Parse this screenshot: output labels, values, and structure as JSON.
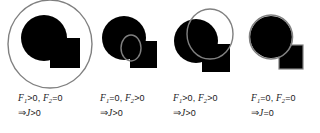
{
  "figure": {
    "name": "overlap-condition-figure",
    "background_color": "#ffffff",
    "shape_fill_color": "#000000",
    "outline_color": "#808080",
    "panel_count": 4
  },
  "panels": [
    {
      "id": "panel-1",
      "label": "large-enclosing-ellipse",
      "caption_line_1": {
        "f1_symbol": "F",
        "f1_subscript": "1",
        "f1_relation": ">0,",
        "f2_symbol": "F",
        "f2_subscript": "2",
        "f2_relation": "=0"
      },
      "caption_line_2": {
        "arrow": "⇒",
        "j_symbol": "J",
        "j_relation": ">0"
      },
      "shapes": {
        "circle": {
          "cx": 42,
          "cy": 38,
          "r": 23,
          "fill": "#000000"
        },
        "square": {
          "x": 48,
          "y": 38,
          "w": 30,
          "h": 30,
          "fill": "#000000"
        },
        "ellipse": {
          "cx": 48,
          "cy": 44,
          "rx": 42,
          "ry": 44,
          "stroke": "#808080",
          "fill": "none"
        }
      }
    },
    {
      "id": "panel-2",
      "label": "small-ellipse-at-overlap",
      "caption_line_1": {
        "f1_symbol": "F",
        "f1_subscript": "1",
        "f1_relation": "=0,",
        "f2_symbol": "F",
        "f2_subscript": "2",
        "f2_relation": ">0"
      },
      "caption_line_2": {
        "arrow": "⇒",
        "j_symbol": "J",
        "j_relation": ">0"
      },
      "shapes": {
        "circle": {
          "cx": 30,
          "cy": 38,
          "r": 22,
          "fill": "#000000"
        },
        "square": {
          "x": 36,
          "y": 41,
          "w": 27,
          "h": 27,
          "fill": "#000000"
        },
        "ellipse": {
          "cx": 37,
          "cy": 48,
          "rx": 10,
          "ry": 13,
          "stroke": "#808080",
          "fill": "none"
        }
      }
    },
    {
      "id": "panel-3",
      "label": "medium-ellipse-overlapping-both",
      "caption_line_1": {
        "f1_symbol": "F",
        "f1_subscript": "1",
        "f1_relation": ">0,",
        "f2_symbol": "F",
        "f2_subscript": "2",
        "f2_relation": ">0"
      },
      "caption_line_2": {
        "arrow": "⇒",
        "j_symbol": "J",
        "j_relation": ">0"
      },
      "shapes": {
        "circle": {
          "cx": 30,
          "cy": 41,
          "r": 22,
          "fill": "#000000"
        },
        "square": {
          "x": 36,
          "y": 44,
          "w": 28,
          "h": 28,
          "fill": "#000000"
        },
        "ellipse": {
          "cx": 44,
          "cy": 34,
          "rx": 23,
          "ry": 25,
          "stroke": "#808080",
          "fill": "none"
        }
      }
    },
    {
      "id": "panel-4",
      "label": "ellipse-coincident-with-circle",
      "caption_line_1": {
        "f1_symbol": "F",
        "f1_subscript": "1",
        "f1_relation": "=0,",
        "f2_symbol": "F",
        "f2_subscript": "2",
        "f2_relation": "=0"
      },
      "caption_line_2": {
        "arrow": "⇒",
        "j_symbol": "J",
        "j_relation": "=0"
      },
      "shapes": {
        "circle": {
          "cx": 28,
          "cy": 37,
          "r": 21,
          "fill": "#000000"
        },
        "square": {
          "x": 36,
          "y": 45,
          "w": 24,
          "h": 24,
          "fill": "#000000"
        },
        "ellipse": {
          "cx": 28,
          "cy": 37,
          "rx": 21,
          "ry": 22,
          "stroke": "#808080",
          "fill": "none"
        }
      }
    }
  ]
}
